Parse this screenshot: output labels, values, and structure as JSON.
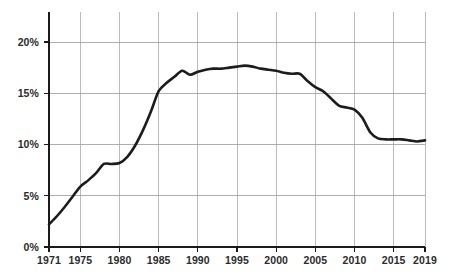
{
  "chart_data": {
    "type": "line",
    "title": "",
    "subtitle": "",
    "xlabel": "",
    "ylabel": "",
    "xlim": [
      1971,
      2019
    ],
    "ylim": [
      0,
      22.5
    ],
    "grid": true,
    "legend": null,
    "y_ticks": [
      0,
      5,
      10,
      15,
      20
    ],
    "y_tick_labels": [
      "0%",
      "5%",
      "10%",
      "15%",
      "20%"
    ],
    "x_ticks": [
      1971,
      1975,
      1980,
      1985,
      1990,
      1995,
      2000,
      2005,
      2010,
      2015,
      2019
    ],
    "x_tick_labels": [
      "1971",
      "1975",
      "1980",
      "1985",
      "1990",
      "1995",
      "2000",
      "2005",
      "2010",
      "2015",
      "2019"
    ],
    "x_gridlines": [
      1971,
      1975,
      1980,
      1985,
      1990,
      1995,
      2000,
      2005,
      2010,
      2015,
      2019
    ],
    "line_color": "#1c1c1c",
    "grid_color": "#9e9e9e",
    "axis_color": "#1a1a1a",
    "background_color": "#ffffff",
    "x": [
      1971,
      1972,
      1973,
      1974,
      1975,
      1976,
      1977,
      1978,
      1979,
      1980,
      1981,
      1982,
      1983,
      1984,
      1985,
      1986,
      1987,
      1988,
      1989,
      1990,
      1991,
      1992,
      1993,
      1994,
      1995,
      1996,
      1997,
      1998,
      1999,
      2000,
      2001,
      2002,
      2003,
      2004,
      2005,
      2006,
      2007,
      2008,
      2009,
      2010,
      2011,
      2012,
      2013,
      2014,
      2015,
      2016,
      2017,
      2018,
      2019
    ],
    "values": [
      2.2,
      3.0,
      3.9,
      4.9,
      5.9,
      6.5,
      7.2,
      8.1,
      8.1,
      8.2,
      8.8,
      9.9,
      11.4,
      13.2,
      15.2,
      16.0,
      16.6,
      17.2,
      16.8,
      17.1,
      17.3,
      17.4,
      17.4,
      17.5,
      17.6,
      17.7,
      17.6,
      17.4,
      17.3,
      17.2,
      17.0,
      16.9,
      16.9,
      16.2,
      15.6,
      15.2,
      14.5,
      13.8,
      13.6,
      13.4,
      12.6,
      11.2,
      10.6,
      10.5,
      10.5,
      10.5,
      10.4,
      10.3,
      10.4
    ],
    "series": [
      {
        "name": "value",
        "values": [
          2.2,
          3.0,
          3.9,
          4.9,
          5.9,
          6.5,
          7.2,
          8.1,
          8.1,
          8.2,
          8.8,
          9.9,
          11.4,
          13.2,
          15.2,
          16.0,
          16.6,
          17.2,
          16.8,
          17.1,
          17.3,
          17.4,
          17.4,
          17.5,
          17.6,
          17.7,
          17.6,
          17.4,
          17.3,
          17.2,
          17.0,
          16.9,
          16.9,
          16.2,
          15.6,
          15.2,
          14.5,
          13.8,
          13.6,
          13.4,
          12.6,
          11.2,
          10.6,
          10.5,
          10.5,
          10.5,
          10.4,
          10.3,
          10.4
        ]
      }
    ],
    "annotations": []
  },
  "layout": {
    "plot_left": 49,
    "plot_right": 425,
    "plot_top": 12,
    "plot_bottom": 247
  }
}
